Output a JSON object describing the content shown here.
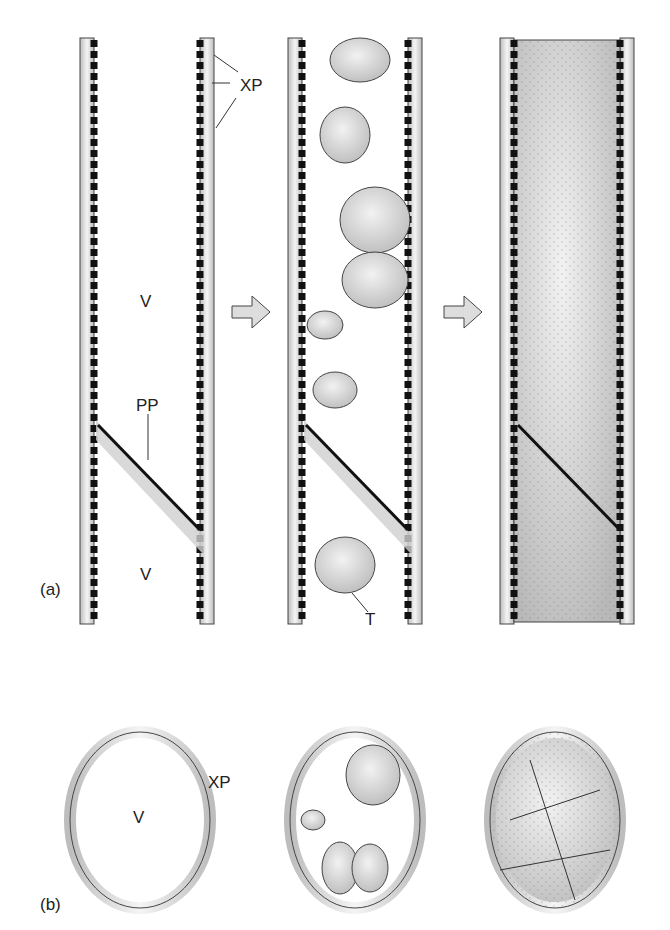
{
  "figure": {
    "panel_a_label": "(a)",
    "panel_b_label": "(b)",
    "labels": {
      "xylem_parenchyma": "XP",
      "vessel": "V",
      "perforation_plate": "PP",
      "tylose": "T"
    },
    "stages": [
      "empty vessel",
      "tyloses forming",
      "vessel occluded by tyloses"
    ],
    "colors": {
      "pit": "#111111",
      "cell_fill": "#e6e6e6",
      "outline": "#333333",
      "plate_shade": "#cfcfcf"
    }
  }
}
